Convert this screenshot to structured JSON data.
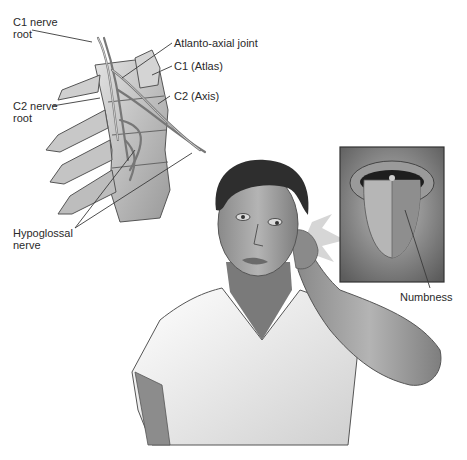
{
  "figure": {
    "labels": {
      "c1_nerve_root": "C1 nerve\nroot",
      "atlanto_axial_joint": "Atlanto-axial joint",
      "c1_atlas": "C1 (Atlas)",
      "c2_axis": "C2 (Axis)",
      "c2_nerve_root": "C2 nerve\nroot",
      "hypoglossal_nerve": "Hypoglossal\nnerve",
      "numbness": "Numbness"
    },
    "panels": {
      "spine": "Lateral view of upper cervical spine with nerves",
      "patient": "Woman holding back of neck",
      "inset": "Close-up of protruded tongue, one half shaded"
    },
    "colors": {
      "line": "#3a3a3a",
      "bone": "#c9c9c9",
      "bone_shade": "#8e8e8e",
      "skin": "#9a9a9a",
      "skin_dark": "#6e6e6e",
      "hair": "#2e2e2e",
      "shirt": "#f2f2f2",
      "inset_bg": "#7a7a7a"
    }
  }
}
